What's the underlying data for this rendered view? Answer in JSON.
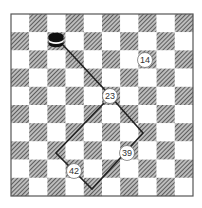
{
  "board": {
    "rows": 10,
    "cols": 10,
    "origin": [
      11,
      14
    ],
    "square_size": 18.2,
    "light_color": "#ffffff",
    "dark_pattern": "hatched",
    "dark_color": "#6e6e6e",
    "border_color": "#555555"
  },
  "piece": {
    "name": "checker-king-stack",
    "center": [
      56,
      40
    ],
    "color": "#111111"
  },
  "path": {
    "color": "#222222",
    "points": [
      [
        63,
        45
      ],
      [
        104,
        89
      ],
      [
        143,
        133
      ],
      [
        92,
        189
      ],
      [
        56,
        153
      ],
      [
        104,
        103
      ]
    ]
  },
  "move_labels": [
    {
      "text": "14",
      "center": [
        145,
        60
      ]
    },
    {
      "text": "23",
      "center": [
        110,
        96
      ]
    },
    {
      "text": "39",
      "center": [
        127,
        153
      ]
    },
    {
      "text": "42",
      "center": [
        74,
        171
      ]
    }
  ]
}
